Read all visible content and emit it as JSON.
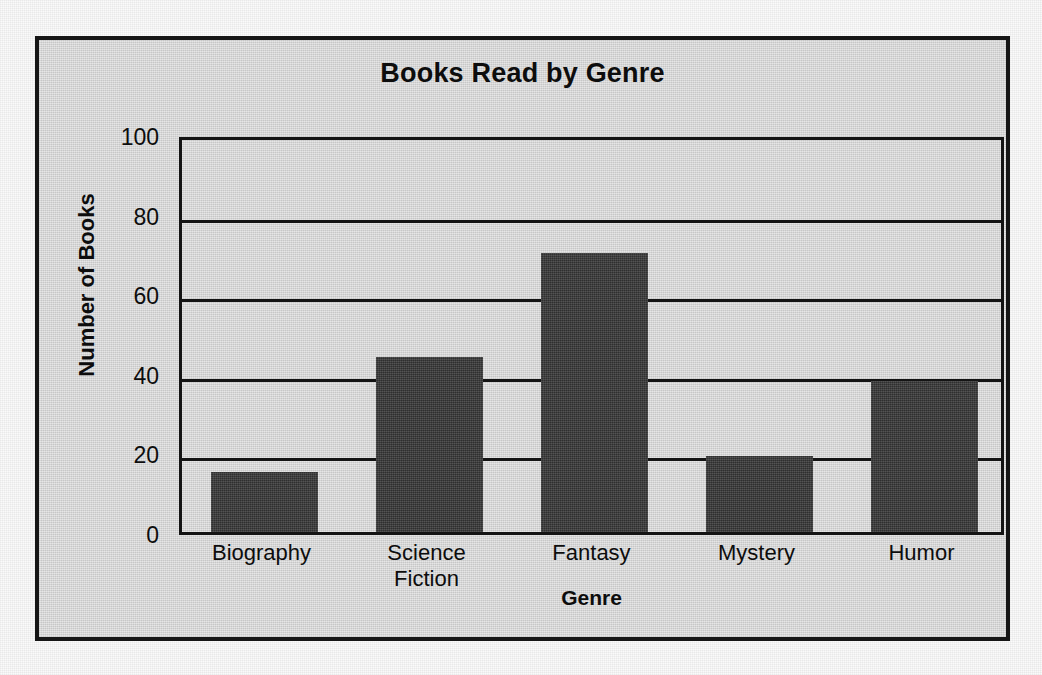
{
  "chart_data": {
    "type": "bar",
    "title": "Books Read by Genre",
    "xlabel": "Genre",
    "ylabel": "Number of Books",
    "categories": [
      "Biography",
      "Science Fiction",
      "Fantasy",
      "Mystery",
      "Humor"
    ],
    "category_lines": [
      [
        "Biography"
      ],
      [
        "Science",
        "Fiction"
      ],
      [
        "Fantasy"
      ],
      [
        "Mystery"
      ],
      [
        "Humor"
      ]
    ],
    "values": [
      15,
      44,
      70,
      19,
      38
    ],
    "ylim": [
      0,
      100
    ],
    "yticks": [
      0,
      20,
      40,
      60,
      80,
      100
    ],
    "ytick_labels": [
      "0",
      "20",
      "40",
      "60",
      "80",
      "100"
    ],
    "grid": "horizontal",
    "legend": "none",
    "bar_color": "#3b3b3b",
    "frame_color": "#151515",
    "background_color": "#d8d8d8",
    "text_color": "#0d0d0d"
  }
}
